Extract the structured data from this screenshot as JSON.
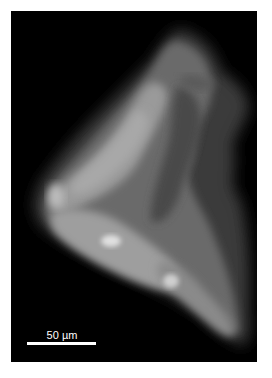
{
  "image": {
    "type": "fluorescence micrograph",
    "background_color": "#000000",
    "frame_border_color": "#ffffff"
  },
  "scale_bar": {
    "label": "50 µm",
    "color": "#ffffff",
    "length_px": 69
  }
}
